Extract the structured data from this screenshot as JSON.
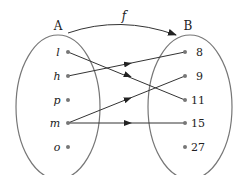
{
  "diagram": {
    "function_label": "f",
    "set_a": {
      "label": "A",
      "elements": [
        "l",
        "h",
        "p",
        "m",
        "o"
      ]
    },
    "set_b": {
      "label": "B",
      "elements": [
        "8",
        "9",
        "11",
        "15",
        "27"
      ]
    },
    "mappings": [
      {
        "from": "l",
        "to": "11"
      },
      {
        "from": "h",
        "to": "8"
      },
      {
        "from": "m",
        "to": "9"
      },
      {
        "from": "m",
        "to": "15"
      }
    ],
    "colors": {
      "ellipse": "#777777",
      "arrow": "#333333",
      "dot": "#777777"
    }
  }
}
